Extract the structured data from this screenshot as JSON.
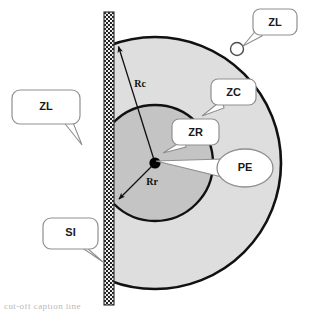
{
  "figure": {
    "background_color": "#ffffff",
    "width": 309,
    "height": 317
  },
  "colors": {
    "outline": "#000000",
    "zone_zc_fill": "#dedede",
    "zone_zr_fill": "#c4c4c4",
    "callout_fill": "#ffffff",
    "callout_stroke": "#8f8f8f",
    "leader_line": "#9a9a9a",
    "interface_dark": "#2b2b2b",
    "interface_light": "#f2f2f2",
    "text": "#1a1a1a"
  },
  "geometry": {
    "center_x": 155,
    "center_y": 163,
    "zc_radius": 126,
    "zr_radius": 58,
    "interface_x": 104,
    "interface_top": 12,
    "interface_bottom": 305,
    "interface_width": 10
  },
  "labels": {
    "zl_right": "ZL",
    "zl_left": "ZL",
    "zc": "ZC",
    "zr": "ZR",
    "pe": "PE",
    "si": "SI"
  },
  "dimensions": {
    "rc": "Rc",
    "rr": "Rr"
  },
  "callouts": [
    {
      "id": "zl-right",
      "label": "ZL",
      "shape": "rounded-rect",
      "meaning": "far-field zone marker at small circle"
    },
    {
      "id": "zc",
      "label": "ZC",
      "shape": "rounded-rect",
      "meaning": "outer light gray zone"
    },
    {
      "id": "zr",
      "label": "ZR",
      "shape": "rounded-rect",
      "meaning": "inner darker gray zone"
    },
    {
      "id": "pe",
      "label": "PE",
      "shape": "ellipse",
      "meaning": "point electrode at center"
    },
    {
      "id": "zl-left",
      "label": "ZL",
      "shape": "rounded-rect",
      "meaning": "zone left of interface"
    },
    {
      "id": "si",
      "label": "SI",
      "shape": "rounded-rect",
      "meaning": "hatched vertical interface bar"
    }
  ],
  "caption": {
    "text": "cut-off caption line"
  }
}
